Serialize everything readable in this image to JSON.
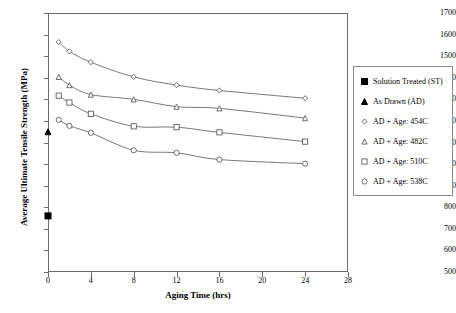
{
  "chart_data": {
    "type": "scatter",
    "title": "",
    "xlabel": "Aging Time (hrs)",
    "ylabel": "Average Ultimate Tensile Strength (MPa)",
    "xlim": [
      0,
      28
    ],
    "ylim": [
      500,
      1700
    ],
    "xticks": [
      0,
      4,
      8,
      12,
      16,
      20,
      24,
      28
    ],
    "yticks": [
      500,
      600,
      700,
      800,
      900,
      1000,
      1100,
      1200,
      1300,
      1400,
      1500,
      1600,
      1700
    ],
    "grid": false,
    "legend_position": "right-outside",
    "series": [
      {
        "name": "Solution Treated (ST)",
        "marker": "filled-square",
        "trendline": false,
        "x": [
          0
        ],
        "y": [
          760
        ]
      },
      {
        "name": "As Drawn (AD)",
        "marker": "filled-triangle",
        "trendline": false,
        "x": [
          0
        ],
        "y": [
          1150
        ]
      },
      {
        "name": "AD + Age: 454C",
        "marker": "open-diamond",
        "trendline": true,
        "x": [
          1,
          2,
          4,
          8,
          12,
          16,
          24
        ],
        "y": [
          1565,
          1522,
          1472,
          1404,
          1366,
          1341,
          1305
        ]
      },
      {
        "name": "AD + Age: 482C",
        "marker": "open-triangle",
        "trendline": true,
        "x": [
          1,
          2,
          4,
          8,
          12,
          16,
          24
        ],
        "y": [
          1404,
          1366,
          1322,
          1300,
          1266,
          1258,
          1213
        ]
      },
      {
        "name": "AD + Age: 510C",
        "marker": "open-square",
        "trendline": true,
        "x": [
          1,
          2,
          4,
          8,
          12,
          16,
          24
        ],
        "y": [
          1317,
          1285,
          1233,
          1175,
          1171,
          1147,
          1104
        ]
      },
      {
        "name": "AD + Age: 538C",
        "marker": "open-circle",
        "trendline": true,
        "x": [
          1,
          2,
          4,
          8,
          12,
          16,
          24
        ],
        "y": [
          1205,
          1177,
          1145,
          1064,
          1052,
          1021,
          1002
        ]
      }
    ],
    "colors": {
      "axis": "#6b6b6b",
      "marker_stroke": "#4a4a4a",
      "marker_fill": "#000000",
      "trendline": "#555555",
      "legend_border": "#8a8a8a"
    }
  }
}
